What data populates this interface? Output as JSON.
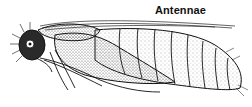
{
  "figure": {
    "labels": [
      {
        "id": "antennae",
        "text": "Antennae"
      }
    ]
  },
  "colors": {
    "ink": "#111111",
    "stipple": "#444444",
    "background": "#ffffff"
  }
}
